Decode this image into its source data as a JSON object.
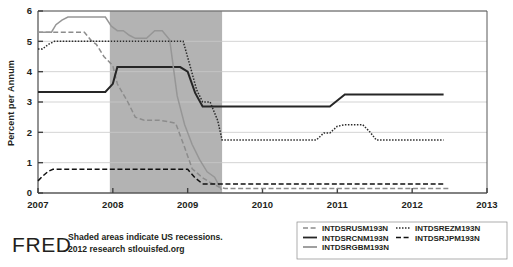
{
  "chart_data": {
    "type": "line",
    "title": "",
    "xlabel": "",
    "ylabel": "Percent per Annum",
    "xlim": [
      2007.0,
      2013.0
    ],
    "ylim": [
      0,
      6
    ],
    "xticks": [
      "2007",
      "2008",
      "2009",
      "2010",
      "2011",
      "2012",
      "2013"
    ],
    "xtick_values": [
      2007,
      2008,
      2009,
      2010,
      2011,
      2012,
      2013
    ],
    "yticks": [
      "0",
      "1",
      "2",
      "3",
      "4",
      "5",
      "6"
    ],
    "ytick_values": [
      0,
      1,
      2,
      3,
      4,
      5,
      6
    ],
    "grid": true,
    "legend_position": "bottom-right",
    "shaded_regions": [
      {
        "label": "US recession",
        "x_start": 2007.96,
        "x_end": 2009.46,
        "color": "#b3b3b3"
      }
    ],
    "series": [
      {
        "name": "INTDSRUSM193N",
        "style": "dashed",
        "color": "#8c8c8c",
        "x": [
          2007.0,
          2007.08,
          2007.3,
          2007.34,
          2007.62,
          2007.72,
          2007.78,
          2007.88,
          2008.0,
          2008.06,
          2008.2,
          2008.3,
          2008.42,
          2008.5,
          2008.62,
          2008.75,
          2008.84,
          2008.96,
          2009.06,
          2009.2,
          2009.3,
          2009.42,
          2009.5,
          2012.5
        ],
        "y": [
          5.3,
          5.3,
          5.3,
          5.3,
          5.3,
          5.0,
          4.9,
          4.5,
          4.2,
          3.6,
          3.0,
          2.5,
          2.4,
          2.4,
          2.4,
          2.35,
          2.3,
          1.5,
          0.8,
          0.5,
          0.35,
          0.2,
          0.15,
          0.15
        ]
      },
      {
        "name": "INTDSRCNM193N",
        "style": "solid",
        "color": "#262626",
        "x": [
          2007.0,
          2007.9,
          2008.0,
          2008.06,
          2008.9,
          2009.0,
          2009.1,
          2009.2,
          2009.28,
          2010.9,
          2011.0,
          2011.1,
          2012.42
        ],
        "y": [
          3.33,
          3.33,
          3.6,
          4.15,
          4.15,
          4.0,
          3.3,
          2.85,
          2.85,
          2.85,
          3.05,
          3.25,
          3.25
        ]
      },
      {
        "name": "INTDSRGBM193N",
        "style": "solid",
        "color": "#969696",
        "x": [
          2007.0,
          2007.18,
          2007.24,
          2007.32,
          2007.4,
          2007.48,
          2007.56,
          2007.9,
          2007.98,
          2008.06,
          2008.14,
          2008.22,
          2008.3,
          2008.45,
          2008.56,
          2008.66,
          2008.76,
          2008.86,
          2008.96,
          2009.06,
          2009.16,
          2009.26,
          2009.36,
          2009.45
        ],
        "y": [
          5.3,
          5.3,
          5.55,
          5.7,
          5.8,
          5.8,
          5.8,
          5.8,
          5.5,
          5.35,
          5.35,
          5.2,
          5.1,
          5.1,
          5.35,
          5.35,
          5.05,
          3.2,
          2.25,
          1.6,
          1.1,
          0.7,
          0.52,
          0.1
        ]
      },
      {
        "name": "INTDSREZM193N",
        "style": "dotted",
        "color": "#2b2b2b",
        "x": [
          2007.0,
          2007.06,
          2007.14,
          2007.22,
          2007.3,
          2008.94,
          2009.02,
          2009.12,
          2009.2,
          2009.3,
          2009.4,
          2009.46,
          2010.72,
          2010.82,
          2010.9,
          2011.0,
          2011.1,
          2011.34,
          2011.44,
          2011.52,
          2012.42
        ],
        "y": [
          4.75,
          4.75,
          4.9,
          5.0,
          5.0,
          5.0,
          4.3,
          3.4,
          3.0,
          3.0,
          2.4,
          1.75,
          1.75,
          1.98,
          1.98,
          2.2,
          2.25,
          2.25,
          2.0,
          1.75,
          1.75
        ]
      },
      {
        "name": "INTDSRJPM193N",
        "style": "dashed",
        "color": "#111111",
        "x": [
          2007.0,
          2007.06,
          2007.14,
          2007.2,
          2008.9,
          2009.0,
          2009.1,
          2009.2,
          2009.3,
          2012.42
        ],
        "y": [
          0.4,
          0.55,
          0.72,
          0.78,
          0.78,
          0.78,
          0.5,
          0.3,
          0.3,
          0.3
        ]
      }
    ]
  },
  "legend": {
    "entries": [
      {
        "label": "INTDSRUSM193N",
        "style": "dashed",
        "color": "#8c8c8c",
        "column": 0
      },
      {
        "label": "INTDSRCNM193N",
        "style": "solid",
        "color": "#262626",
        "column": 0
      },
      {
        "label": "INTDSRGBM193N",
        "style": "solid",
        "color": "#969696",
        "column": 0
      },
      {
        "label": "INTDSREZM193N",
        "style": "dotted",
        "color": "#2b2b2b",
        "column": 1
      },
      {
        "label": "INTDSRJPM193N",
        "style": "dashed",
        "color": "#111111",
        "column": 1
      }
    ]
  },
  "footer": {
    "logo": "FRED",
    "note_line1": "Shaded areas indicate US recessions.",
    "note_line2": "2012 research stlouisfed.org"
  },
  "colors": {
    "recession_shade": "#b3b3b3",
    "gridline": "#c8c8c8",
    "axis": "#595959",
    "text": "#231f20",
    "background": "#ffffff"
  }
}
